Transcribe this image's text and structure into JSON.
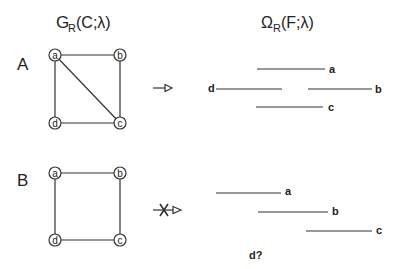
{
  "headers": {
    "left": {
      "main": "G",
      "sub": "R",
      "rest": "(C;λ)"
    },
    "right": {
      "main": "Ω",
      "sub": "R",
      "rest": "(F;λ)"
    }
  },
  "panels": [
    {
      "label": "A",
      "nodes": [
        "a",
        "b",
        "c",
        "d"
      ],
      "edges": [
        [
          "a",
          "b"
        ],
        [
          "b",
          "c"
        ],
        [
          "c",
          "d"
        ],
        [
          "d",
          "a"
        ],
        [
          "a",
          "c"
        ]
      ],
      "arrow": "implies",
      "intervals": [
        {
          "label": "a"
        },
        {
          "label": "d"
        },
        {
          "label": "b"
        },
        {
          "label": "c"
        }
      ]
    },
    {
      "label": "B",
      "nodes": [
        "a",
        "b",
        "c",
        "d"
      ],
      "edges": [
        [
          "a",
          "b"
        ],
        [
          "b",
          "c"
        ],
        [
          "c",
          "d"
        ],
        [
          "d",
          "a"
        ]
      ],
      "arrow": "does-not-imply",
      "intervals": [
        {
          "label": "a"
        },
        {
          "label": "b"
        },
        {
          "label": "c"
        }
      ],
      "missing": "d?"
    }
  ]
}
